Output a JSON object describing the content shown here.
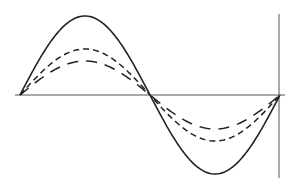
{
  "chart_data": {
    "type": "line",
    "title": "",
    "xlabel": "",
    "ylabel": "",
    "x_range_px": [
      20,
      280
    ],
    "baseline_y_px": 95,
    "vertical_axis_x_px": 279,
    "vertical_axis_y_range_px": [
      14,
      178
    ],
    "horizontal_axis_x_range_px": [
      15,
      285
    ],
    "series": [
      {
        "name": "solid",
        "style": "solid",
        "relative_amplitude": 1.0,
        "amplitude_px": 79
      },
      {
        "name": "short-dash",
        "style": "dashed-short",
        "relative_amplitude": 0.58,
        "amplitude_px": 46
      },
      {
        "name": "long-dash",
        "style": "dashed-long",
        "relative_amplitude": 0.43,
        "amplitude_px": 34
      }
    ],
    "colors": {
      "line": "#222222",
      "axis": "#555555",
      "background": "#ffffff"
    }
  }
}
